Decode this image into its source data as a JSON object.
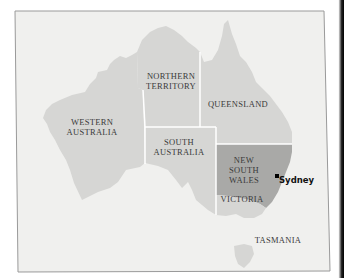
{
  "map": {
    "title": "",
    "colors": {
      "ocean": "#f0f0ee",
      "land": "#d6d6d4",
      "highlight": "#a9a9a7",
      "border": "#ffffff",
      "frame": "#9a9a9a"
    },
    "regions": [
      {
        "id": "wa",
        "label": "WESTERN\nAUSTRALIA"
      },
      {
        "id": "nt",
        "label": "NORTHERN\nTERRITORY"
      },
      {
        "id": "qld",
        "label": "QUEENSLAND"
      },
      {
        "id": "sa",
        "label": "SOUTH\nAUSTRALIA"
      },
      {
        "id": "nsw",
        "label": "NEW\nSOUTH\nWALES",
        "highlighted": true
      },
      {
        "id": "vic",
        "label": "VICTORIA"
      },
      {
        "id": "tas",
        "label": "TASMANIA"
      }
    ],
    "cities": [
      {
        "name": "Sydney"
      }
    ]
  }
}
